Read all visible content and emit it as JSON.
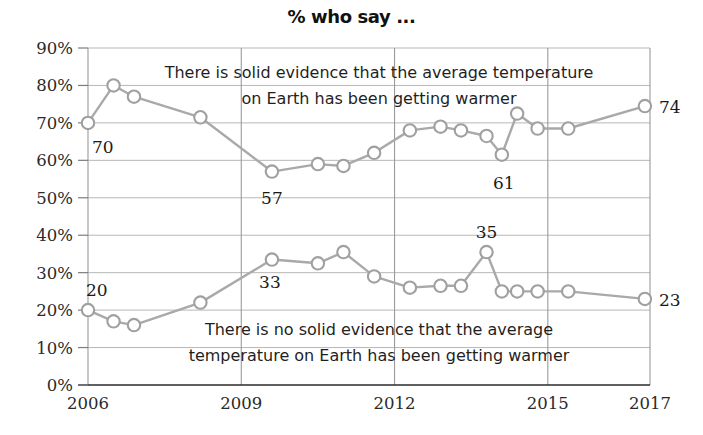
{
  "chart_data": {
    "type": "line",
    "title": "% who say ...",
    "xlabel": "",
    "ylabel": "",
    "xlim": [
      2006,
      2017
    ],
    "ylim": [
      0,
      90
    ],
    "y_ticks": [
      "0%",
      "10%",
      "20%",
      "30%",
      "40%",
      "50%",
      "60%",
      "70%",
      "80%",
      "90%"
    ],
    "y_tick_values": [
      0,
      10,
      20,
      30,
      40,
      50,
      60,
      70,
      80,
      90
    ],
    "x_ticks": [
      "2006",
      "2009",
      "2012",
      "2015",
      "2017"
    ],
    "x_tick_values": [
      2006,
      2009,
      2012,
      2015,
      2017
    ],
    "grid": "horizontal-and-vertical",
    "legend_position": "inline-annotation",
    "line_color": "#a9a9a9",
    "marker_fill": "#ffffff",
    "marker_stroke": "#a0a0a0",
    "series": [
      {
        "name": "There is solid evidence that the average temperature on Earth has been getting warmer",
        "annotation": "There is solid evidence that the average temperature on Earth has been getting warmer",
        "x": [
          2006.0,
          2006.5,
          2006.9,
          2008.2,
          2009.6,
          2010.5,
          2011.0,
          2011.6,
          2012.3,
          2012.9,
          2013.3,
          2013.8,
          2014.1,
          2014.4,
          2014.8,
          2015.4,
          2016.9
        ],
        "values": [
          70,
          80,
          77,
          71.5,
          57,
          59,
          58.5,
          62,
          68,
          69,
          68,
          66.5,
          61.5,
          72.5,
          68.5,
          68.5,
          74.5
        ],
        "labeled_points": [
          {
            "x": 2006.0,
            "value": 70,
            "label": "70"
          },
          {
            "x": 2009.6,
            "value": 57,
            "label": "57"
          },
          {
            "x": 2014.1,
            "value": 61.5,
            "label": "61"
          },
          {
            "x": 2016.9,
            "value": 74.5,
            "label": "74"
          }
        ],
        "end_label": "74"
      },
      {
        "name": "There is no solid evidence that the average temperature on Earth has been getting warmer",
        "annotation": "There is no solid evidence that the average temperature on Earth has been getting warmer",
        "x": [
          2006.0,
          2006.5,
          2006.9,
          2008.2,
          2009.6,
          2010.5,
          2011.0,
          2011.6,
          2012.3,
          2012.9,
          2013.3,
          2013.8,
          2014.1,
          2014.4,
          2014.8,
          2015.4,
          2016.9
        ],
        "values": [
          20,
          17,
          16,
          22,
          33.5,
          32.5,
          35.5,
          29,
          26,
          26.5,
          26.5,
          35.5,
          25,
          25,
          25,
          25,
          23
        ],
        "labeled_points": [
          {
            "x": 2006.0,
            "value": 20,
            "label": "20"
          },
          {
            "x": 2009.6,
            "value": 33.5,
            "label": "33"
          },
          {
            "x": 2013.8,
            "value": 35.5,
            "label": "35"
          },
          {
            "x": 2016.9,
            "value": 23,
            "label": "23"
          }
        ],
        "end_label": "23"
      }
    ],
    "annotations": [
      {
        "id": "upper-annotation",
        "lines": [
          "There is solid evidence that the average temperature",
          "on Earth has been getting warmer"
        ]
      },
      {
        "id": "lower-annotation",
        "lines": [
          "There is no solid evidence that the average",
          "temperature on Earth has been getting warmer"
        ]
      }
    ]
  }
}
